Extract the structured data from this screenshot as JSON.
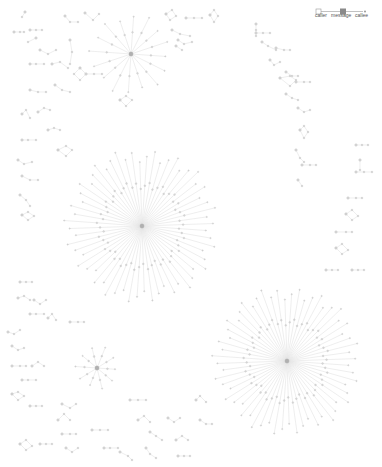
{
  "legend": {
    "caller_left": "caller",
    "message": "message",
    "callee": "callee"
  },
  "colors": {
    "edge": "#e3e3e3",
    "node_fill": "#d8d8d8",
    "node_stroke": "#bdbdbd",
    "hub_fill": "#b0b0b0",
    "legend_box": "#8a8a8a"
  },
  "hubs": [
    {
      "name": "hub-top",
      "cx": 131,
      "cy": 54,
      "r": 42,
      "spokes": 16
    },
    {
      "name": "hub-center",
      "cx": 142,
      "cy": 226,
      "r": 78,
      "spokes": 60
    },
    {
      "name": "hub-bottom-right",
      "cx": 287,
      "cy": 361,
      "r": 75,
      "spokes": 60
    },
    {
      "name": "hub-bottom-left",
      "cx": 97,
      "cy": 368,
      "r": 22,
      "spokes": 10
    }
  ],
  "chains": [
    [
      14,
      32,
      20,
      32,
      24,
      32
    ],
    [
      25,
      12,
      22,
      17
    ],
    [
      30,
      30,
      36,
      30,
      42,
      30
    ],
    [
      36,
      38,
      28,
      42
    ],
    [
      65,
      16,
      70,
      22,
      78,
      22
    ],
    [
      85,
      13,
      93,
      20,
      99,
      14
    ],
    [
      70,
      40,
      72,
      52,
      70,
      64
    ],
    [
      40,
      50,
      48,
      54,
      56,
      50
    ],
    [
      52,
      64,
      60,
      62,
      68,
      68
    ],
    [
      30,
      64,
      36,
      64,
      44,
      64
    ],
    [
      80,
      68,
      86,
      74,
      80,
      80,
      74,
      74,
      80,
      68
    ],
    [
      86,
      74,
      94,
      74,
      102,
      74
    ],
    [
      55,
      85,
      62,
      90,
      70,
      92
    ],
    [
      30,
      90,
      38,
      92,
      46,
      92
    ],
    [
      120,
      100,
      126,
      96,
      132,
      100,
      126,
      106,
      120,
      100
    ],
    [
      166,
      14,
      172,
      10,
      176,
      16,
      170,
      20,
      166,
      14
    ],
    [
      186,
      18,
      194,
      18,
      202,
      18
    ],
    [
      210,
      15,
      214,
      10,
      218,
      16,
      214,
      22,
      210,
      15
    ],
    [
      172,
      30,
      180,
      34,
      190,
      36
    ],
    [
      178,
      40,
      184,
      44,
      192,
      42
    ],
    [
      176,
      46,
      182,
      50
    ],
    [
      256,
      24,
      256,
      30,
      256,
      36
    ],
    [
      256,
      33,
      263,
      33,
      270,
      33
    ],
    [
      262,
      42,
      268,
      46,
      276,
      50
    ],
    [
      276,
      48,
      284,
      50,
      290,
      50
    ],
    [
      270,
      60,
      274,
      65,
      280,
      62
    ],
    [
      286,
      72,
      292,
      76,
      298,
      76
    ],
    [
      280,
      78,
      290,
      76,
      296,
      80,
      290,
      86,
      280,
      78
    ],
    [
      296,
      82,
      304,
      82,
      310,
      82
    ],
    [
      286,
      94,
      292,
      98,
      298,
      100
    ],
    [
      298,
      108,
      304,
      112,
      310,
      110
    ],
    [
      300,
      130,
      304,
      126,
      308,
      132,
      304,
      138,
      300,
      130
    ],
    [
      296,
      150,
      300,
      158,
      304,
      162
    ],
    [
      302,
      165,
      310,
      165,
      316,
      165
    ],
    [
      298,
      180,
      302,
      186
    ],
    [
      22,
      114,
      26,
      110,
      30,
      118
    ],
    [
      38,
      112,
      44,
      108,
      50,
      110
    ],
    [
      48,
      130,
      54,
      128,
      60,
      130
    ],
    [
      22,
      140,
      28,
      140,
      36,
      140
    ],
    [
      18,
      160,
      24,
      164,
      32,
      162
    ],
    [
      22,
      176,
      30,
      180,
      38,
      180
    ],
    [
      58,
      150,
      66,
      146,
      72,
      150,
      66,
      156,
      58,
      150
    ],
    [
      20,
      195,
      26,
      200,
      30,
      206
    ],
    [
      22,
      215,
      28,
      212,
      34,
      216,
      28,
      220,
      22,
      215
    ],
    [
      356,
      145,
      362,
      145,
      368,
      145
    ],
    [
      360,
      160,
      360,
      170
    ],
    [
      356,
      172,
      364,
      172,
      372,
      172
    ],
    [
      348,
      198,
      356,
      198,
      362,
      198
    ],
    [
      346,
      214,
      352,
      210,
      358,
      216,
      352,
      220,
      346,
      214
    ],
    [
      336,
      232,
      346,
      232,
      352,
      232
    ],
    [
      336,
      248,
      342,
      244,
      348,
      250,
      342,
      254,
      336,
      248
    ],
    [
      326,
      270,
      332,
      270,
      338,
      270
    ],
    [
      352,
      270,
      358,
      270,
      364,
      270
    ],
    [
      20,
      282,
      26,
      282,
      32,
      282
    ],
    [
      18,
      298,
      24,
      296,
      30,
      300
    ],
    [
      34,
      300,
      40,
      304,
      46,
      300
    ],
    [
      30,
      314,
      36,
      314,
      44,
      314
    ],
    [
      48,
      318,
      52,
      314,
      56,
      320
    ],
    [
      70,
      322,
      78,
      322,
      84,
      322
    ],
    [
      8,
      332,
      14,
      334,
      20,
      330
    ],
    [
      12,
      346,
      18,
      350,
      24,
      348
    ],
    [
      12,
      366,
      20,
      366,
      26,
      366
    ],
    [
      32,
      366,
      38,
      362,
      44,
      366
    ],
    [
      22,
      380,
      28,
      380,
      36,
      380
    ],
    [
      12,
      394,
      18,
      392,
      24,
      396,
      18,
      400,
      12,
      394
    ],
    [
      30,
      406,
      36,
      406,
      42,
      406
    ],
    [
      62,
      404,
      70,
      408,
      76,
      404
    ],
    [
      58,
      420,
      64,
      414,
      70,
      420
    ],
    [
      62,
      434,
      70,
      434,
      76,
      434
    ],
    [
      20,
      444,
      26,
      440,
      32,
      446,
      26,
      450,
      20,
      444
    ],
    [
      40,
      444,
      46,
      444,
      52,
      444
    ],
    [
      92,
      430,
      100,
      430,
      108,
      430
    ],
    [
      66,
      448,
      72,
      452,
      78,
      448
    ],
    [
      130,
      400,
      138,
      400,
      146,
      400
    ],
    [
      138,
      420,
      144,
      416,
      150,
      422
    ],
    [
      104,
      448,
      110,
      448,
      118,
      448
    ],
    [
      150,
      432,
      156,
      436,
      162,
      440
    ],
    [
      176,
      440,
      182,
      436,
      188,
      440
    ],
    [
      168,
      418,
      174,
      422,
      180,
      418
    ],
    [
      178,
      456,
      184,
      456,
      190,
      456
    ],
    [
      120,
      452,
      128,
      456,
      132,
      460
    ],
    [
      146,
      448,
      150,
      454,
      156,
      458
    ],
    [
      196,
      400,
      200,
      396,
      206,
      402
    ],
    [
      200,
      420,
      206,
      424,
      212,
      424
    ]
  ]
}
